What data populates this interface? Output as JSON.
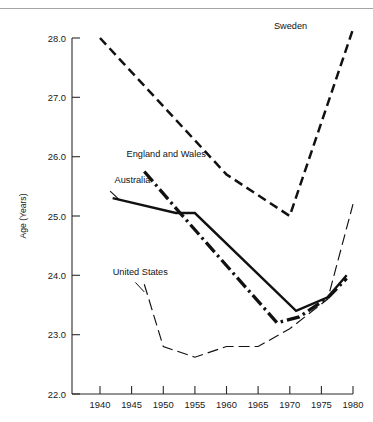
{
  "chart_data": {
    "type": "line",
    "title": "",
    "xlabel": "",
    "ylabel": "Age (Years)",
    "xlim": [
      1938,
      1981
    ],
    "ylim": [
      22.0,
      28.0
    ],
    "grid": false,
    "legend_position": "inline-labels",
    "x_ticks": [
      1940,
      1945,
      1950,
      1955,
      1960,
      1965,
      1970,
      1975,
      1980
    ],
    "x_tick_labels": [
      "1940",
      "1945",
      "1950",
      "1955",
      "1960",
      "1965",
      "1970",
      "1975",
      "1980"
    ],
    "y_ticks": [
      22.0,
      23.0,
      24.0,
      25.0,
      26.0,
      27.0,
      28.0
    ],
    "y_tick_labels": [
      "22.0",
      "23.0",
      "24.0",
      "25.0",
      "26.0",
      "27.0",
      "28.0"
    ],
    "series": [
      {
        "name": "Sweden",
        "style": "dashed",
        "label": "Sweden",
        "label_x": 1967.5,
        "label_y": 28.15,
        "x": [
          1940,
          1960,
          1970,
          1980
        ],
        "values": [
          28.0,
          25.7,
          25.0,
          28.15
        ]
      },
      {
        "name": "England and Wales",
        "style": "dash-dot-thick",
        "label": "England and Wales",
        "label_x": 1944.2,
        "label_y": 26.0,
        "x": [
          1947,
          1952.5,
          1968,
          1971.5,
          1976,
          1979
        ],
        "values": [
          25.75,
          25.07,
          23.2,
          23.3,
          23.62,
          23.95
        ]
      },
      {
        "name": "Australia",
        "style": "solid",
        "label": "Australia",
        "label_x": 1942.3,
        "label_y": 25.55,
        "x": [
          1942,
          1952,
          1955,
          1971,
          1976,
          1979
        ],
        "values": [
          25.3,
          25.05,
          25.05,
          23.4,
          23.63,
          24.0
        ]
      },
      {
        "name": "United States",
        "style": "thin-dashed",
        "label": "United States",
        "label_x": 1942.0,
        "label_y": 24.0,
        "x": [
          1947,
          1950,
          1955,
          1960,
          1965,
          1970,
          1976,
          1980
        ],
        "values": [
          23.85,
          22.8,
          22.62,
          22.8,
          22.8,
          23.1,
          23.6,
          25.2
        ]
      }
    ]
  },
  "axes": {
    "y_axis_title": "Age (Years)"
  }
}
